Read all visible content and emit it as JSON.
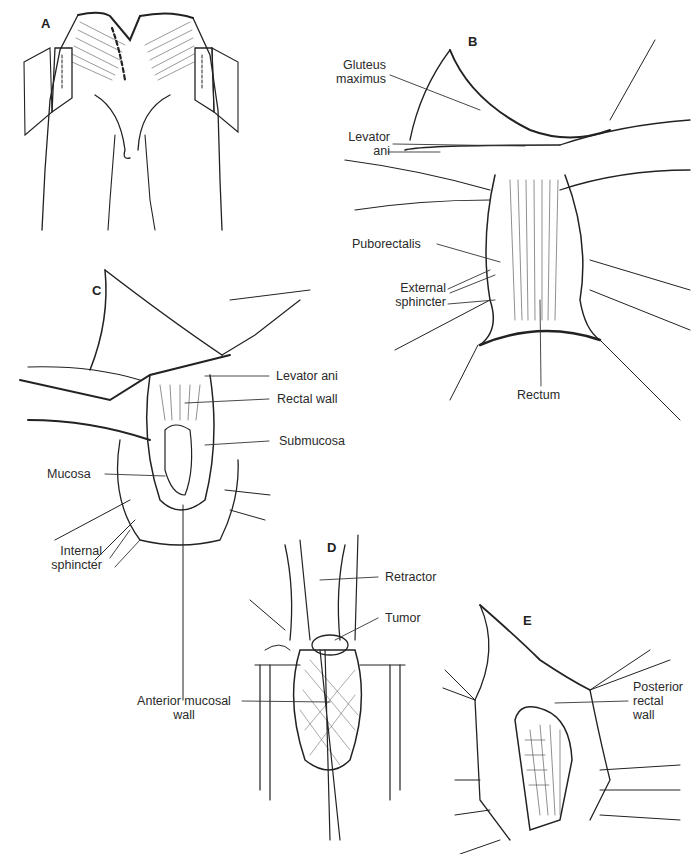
{
  "figure": {
    "panels": [
      {
        "id": "A",
        "label": "A"
      },
      {
        "id": "B",
        "label": "B"
      },
      {
        "id": "C",
        "label": "C"
      },
      {
        "id": "D",
        "label": "D"
      },
      {
        "id": "E",
        "label": "E"
      }
    ],
    "labels": {
      "B": {
        "gluteus_maximus": [
          "Gluteus",
          "maximus"
        ],
        "levator_ani": [
          "Levator",
          "ani"
        ],
        "puborectalis": "Puborectalis",
        "external_sphincter": [
          "External",
          "sphincter"
        ],
        "rectum": "Rectum"
      },
      "C": {
        "levator_ani": "Levator ani",
        "rectal_wall": "Rectal wall",
        "submucosa": "Submucosa",
        "mucosa": "Mucosa",
        "internal_sphincter": [
          "Internal",
          "sphincter"
        ],
        "anterior_mucosal_wall": [
          "Anterior mucosal",
          "wall"
        ]
      },
      "D": {
        "retractor": "Retractor",
        "tumor": "Tumor"
      },
      "E": {
        "posterior_rectal_wall": [
          "Posterior",
          "rectal",
          "wall"
        ]
      }
    }
  }
}
